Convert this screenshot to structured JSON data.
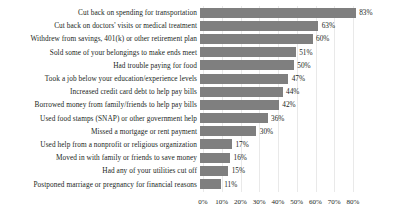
{
  "chart_data": {
    "type": "bar",
    "orientation": "horizontal",
    "title": "",
    "subtitle": "",
    "xlabel": "",
    "ylabel": "",
    "xlim": [
      0,
      80
    ],
    "grid": "vertical",
    "legend": "none",
    "value_suffix": "%",
    "tick_labels": [
      "0%",
      "10%",
      "20%",
      "30%",
      "40%",
      "50%",
      "60%",
      "70%",
      "80%"
    ],
    "ticks": [
      0,
      10,
      20,
      30,
      40,
      50,
      60,
      70,
      80
    ],
    "bar_color": "#7f7f7f",
    "text_color": "#221f1c",
    "gridline_color": "#e9e9e9",
    "background_color": "#ffffff",
    "categories": [
      "Cut back on spending for transportation",
      "Cut back on doctors' visits or medical treatment",
      "Withdrew from savings, 401(k) or other retirement plan",
      "Sold some of your belongings to make ends meet",
      "Had trouble paying for food",
      "Took a job below your education/experience levels",
      "Increased credit card debt to help pay bills",
      "Borrowed money from family/friends to help pay bills",
      "Used food stamps (SNAP) or other government help",
      "Missed a mortgage or rent payment",
      "Used help from a nonprofit or religious organization",
      "Moved in with family or friends to save money",
      "Had any of your utilities cut off",
      "Postponed marriage or pregnancy for financial reasons"
    ],
    "values": [
      83,
      63,
      60,
      51,
      50,
      47,
      44,
      42,
      36,
      30,
      17,
      16,
      15,
      11
    ],
    "value_labels": [
      "83%",
      "63%",
      "60%",
      "51%",
      "50%",
      "47%",
      "44%",
      "42%",
      "36%",
      "30%",
      "17%",
      "16%",
      "15%",
      "11%"
    ]
  }
}
